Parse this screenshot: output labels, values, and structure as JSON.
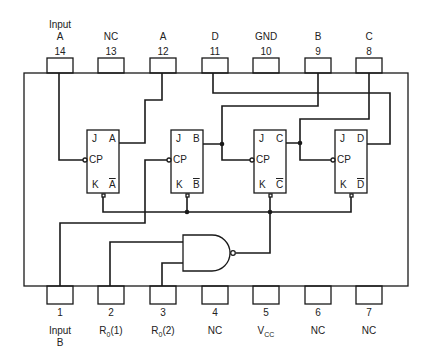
{
  "diagram": {
    "type": "IC pinout / logic diagram",
    "top_pins": [
      {
        "number": "14",
        "label": "A",
        "label_prefix": "Input"
      },
      {
        "number": "13",
        "label": "NC"
      },
      {
        "number": "12",
        "label": "A"
      },
      {
        "number": "11",
        "label": "D"
      },
      {
        "number": "10",
        "label": "GND"
      },
      {
        "number": "9",
        "label": "B"
      },
      {
        "number": "8",
        "label": "C"
      }
    ],
    "bottom_pins": [
      {
        "number": "1",
        "label": "Input",
        "label_suffix": "B"
      },
      {
        "number": "2",
        "label": "R",
        "sub": "0",
        "tail": "(1)"
      },
      {
        "number": "3",
        "label": "R",
        "sub": "0",
        "tail": "(2)"
      },
      {
        "number": "4",
        "label": "NC"
      },
      {
        "number": "5",
        "label": "V",
        "sub": "CC",
        "tail": ""
      },
      {
        "number": "6",
        "label": "NC"
      },
      {
        "number": "7",
        "label": "NC"
      }
    ],
    "flip_flops": [
      {
        "name": "A",
        "j": "J",
        "cp": "CP",
        "k": "K",
        "q": "A",
        "qbar": "A"
      },
      {
        "name": "B",
        "j": "J",
        "cp": "CP",
        "k": "K",
        "q": "B",
        "qbar": "B"
      },
      {
        "name": "C",
        "j": "J",
        "cp": "CP",
        "k": "K",
        "q": "C",
        "qbar": "C"
      },
      {
        "name": "D",
        "j": "J",
        "cp": "CP",
        "k": "K",
        "q": "D",
        "qbar": "D"
      }
    ],
    "gates": [
      {
        "type": "NAND",
        "inputs": 2
      }
    ]
  }
}
